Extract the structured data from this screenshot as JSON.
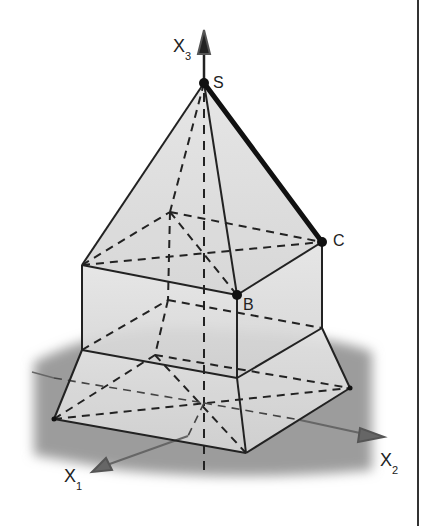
{
  "figure": {
    "axes": {
      "x1": {
        "label": "X",
        "subscript": "1"
      },
      "x2": {
        "label": "X",
        "subscript": "2"
      },
      "x3": {
        "label": "X",
        "subscript": "3"
      }
    },
    "points": {
      "S": {
        "label": "S"
      },
      "B": {
        "label": "B"
      },
      "C": {
        "label": "C"
      }
    },
    "highlighted_edge": "SC",
    "colors": {
      "edge": "#222222",
      "face_fill": "#d9d9d9",
      "ground": "#9a9a9a",
      "axis": "#555555",
      "frame": "#333333"
    }
  }
}
